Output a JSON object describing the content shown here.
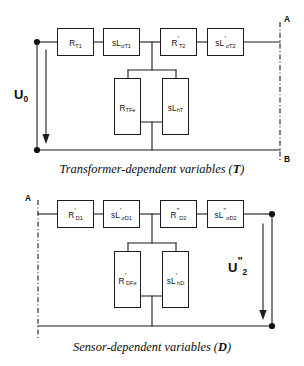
{
  "diagram": {
    "line_color": "#1d1d1d",
    "background": "#ffffff"
  },
  "circuits": [
    {
      "id": "transformer",
      "caption_prefix": "Transformer-dependent variables (",
      "caption_symbol": "T",
      "caption_suffix": ")",
      "source_label": {
        "base": "U",
        "prime": "",
        "sub": "0"
      },
      "terminals": [
        {
          "name": "terminal-a",
          "label": "A",
          "position": "top-right"
        },
        {
          "name": "terminal-b",
          "label": "B",
          "position": "bottom-right"
        }
      ],
      "series_components": [
        {
          "name": "resistor-rt1",
          "base": "R",
          "prime": "",
          "sub": "T1"
        },
        {
          "name": "inductor-slst1",
          "base": "sL",
          "prime": "",
          "sub": "σT1"
        },
        {
          "name": "resistor-rt2",
          "base": "R",
          "prime": "'",
          "sub": "T2"
        },
        {
          "name": "inductor-slst2",
          "base": "sL",
          "prime": "'",
          "sub": "σT2"
        }
      ],
      "shunt_components": [
        {
          "name": "resistor-rtfe",
          "base": "R",
          "prime": "",
          "sub": "TFe"
        },
        {
          "name": "inductor-slht",
          "base": "sL",
          "prime": "",
          "sub": "hT"
        }
      ]
    },
    {
      "id": "sensor",
      "caption_prefix": "Sensor-dependent variables (",
      "caption_symbol": "D",
      "caption_suffix": ")",
      "source_label": {
        "base": "U",
        "prime": "\"",
        "sub": "2"
      },
      "terminals": [
        {
          "name": "terminal-a",
          "label": "A",
          "position": "top-left"
        }
      ],
      "series_components": [
        {
          "name": "resistor-rd1",
          "base": "R",
          "prime": "'",
          "sub": "D1"
        },
        {
          "name": "inductor-slsd1",
          "base": "sL",
          "prime": "'",
          "sub": "σD1"
        },
        {
          "name": "resistor-rd2",
          "base": "R",
          "prime": "\"",
          "sub": "D2"
        },
        {
          "name": "inductor-slsd2",
          "base": "sL",
          "prime": "\"",
          "sub": "σD2"
        }
      ],
      "shunt_components": [
        {
          "name": "resistor-rdfe",
          "base": "R",
          "prime": "'",
          "sub": "DFe"
        },
        {
          "name": "inductor-slhd",
          "base": "sL",
          "prime": "'",
          "sub": "hD"
        }
      ]
    }
  ]
}
